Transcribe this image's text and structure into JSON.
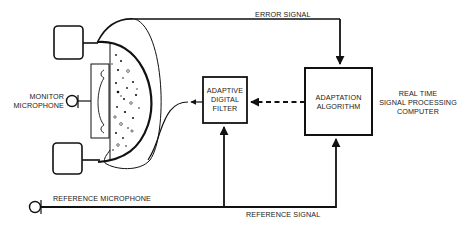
{
  "diagram": {
    "labels": {
      "error_signal": "ERROR SIGNAL",
      "monitor_microphone_line1": "MONITOR",
      "monitor_microphone_line2": "MICROPHONE",
      "reference_microphone": "REFERENCE MICROPHONE",
      "reference_signal": "REFERENCE SIGNAL",
      "adaptive_filter_line1": "ADAPTIVE",
      "adaptive_filter_line2": "DIGITAL",
      "adaptive_filter_line3": "FILTER",
      "adaptation_line1": "ADAPTATION",
      "adaptation_line2": "ALGORITHM",
      "computer_line1": "REAL TIME",
      "computer_line2": "SIGNAL PROCESSING",
      "computer_line3": "COMPUTER"
    },
    "nodes": [
      {
        "id": "monitor-microphone",
        "label": "MONITOR MICROPHONE"
      },
      {
        "id": "reference-microphone",
        "label": "REFERENCE MICROPHONE"
      },
      {
        "id": "adaptive-digital-filter",
        "label": "ADAPTIVE DIGITAL FILTER"
      },
      {
        "id": "adaptation-algorithm",
        "label": "ADAPTATION ALGORITHM"
      },
      {
        "id": "ear-cup",
        "label": ""
      }
    ],
    "edges": [
      {
        "from": "monitor-microphone",
        "to": "adaptation-algorithm",
        "label": "ERROR SIGNAL",
        "style": "solid"
      },
      {
        "from": "reference-microphone",
        "to": "adaptation-algorithm",
        "label": "REFERENCE SIGNAL",
        "style": "solid"
      },
      {
        "from": "reference-microphone",
        "to": "adaptive-digital-filter",
        "label": "",
        "style": "solid"
      },
      {
        "from": "adaptation-algorithm",
        "to": "adaptive-digital-filter",
        "label": "",
        "style": "dashed"
      },
      {
        "from": "adaptive-digital-filter",
        "to": "ear-cup",
        "label": "",
        "style": "solid"
      }
    ],
    "colors": {
      "stroke": "#111111",
      "background": "#ffffff"
    }
  }
}
